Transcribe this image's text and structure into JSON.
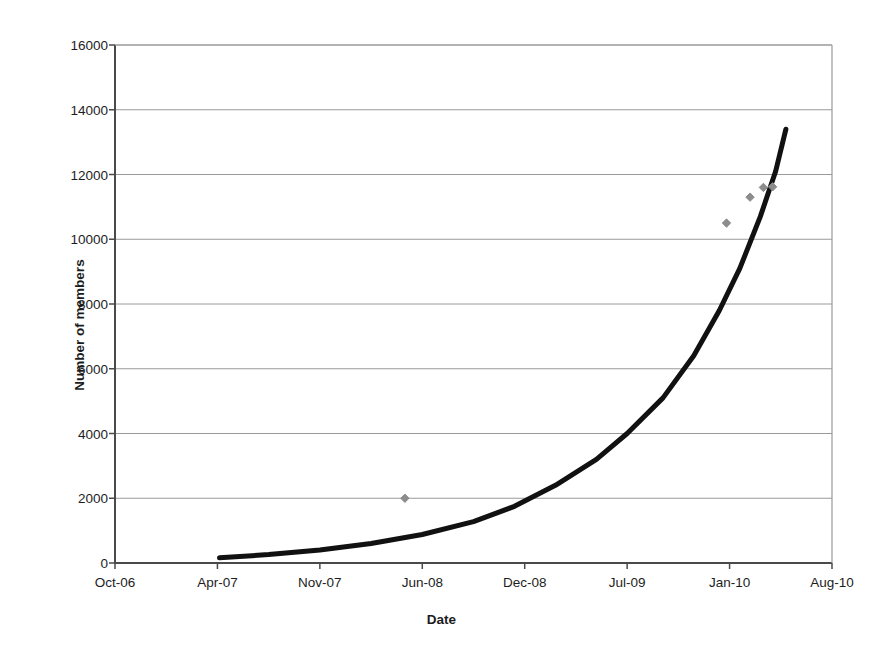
{
  "figure": {
    "title_remnant": "· · ·",
    "background": "#ffffff",
    "axis_color": "#4a4a4a",
    "grid_color": "#9a9a9a",
    "curve_color": "#111111",
    "marker_color": "#8c8c8c"
  },
  "chart_data": {
    "type": "scatter",
    "title": "",
    "xlabel": "Date",
    "ylabel": "Number of members",
    "grid": true,
    "legend": "none",
    "ylim": [
      0,
      16000
    ],
    "ytick_labels": [
      "0",
      "2000",
      "4000",
      "6000",
      "8000",
      "10000",
      "12000",
      "14000",
      "16000"
    ],
    "ytick_values": [
      0,
      2000,
      4000,
      6000,
      8000,
      10000,
      12000,
      14000,
      16000
    ],
    "xtick_labels": [
      "Oct-06",
      "Apr-07",
      "Nov-07",
      "Jun-08",
      "Dec-08",
      "Jul-09",
      "Jan-10",
      "Aug-10"
    ],
    "xtick_values": [
      0,
      1,
      2,
      3,
      4,
      5,
      6,
      7
    ],
    "series": [
      {
        "name": "Members (observed)",
        "type": "scatter",
        "marker": "diamond",
        "color": "#8c8c8c",
        "points": [
          {
            "x": 2.83,
            "y": 2000
          },
          {
            "x": 5.97,
            "y": 10500
          },
          {
            "x": 6.2,
            "y": 11300
          },
          {
            "x": 6.33,
            "y": 11600
          },
          {
            "x": 6.42,
            "y": 11620
          }
        ]
      },
      {
        "name": "Exponential trend",
        "type": "line",
        "color": "#111111",
        "linewidth": 5,
        "points": [
          {
            "x": 1.02,
            "y": 160
          },
          {
            "x": 1.5,
            "y": 260
          },
          {
            "x": 2.0,
            "y": 400
          },
          {
            "x": 2.5,
            "y": 600
          },
          {
            "x": 3.0,
            "y": 880
          },
          {
            "x": 3.5,
            "y": 1280
          },
          {
            "x": 3.9,
            "y": 1750
          },
          {
            "x": 4.3,
            "y": 2400
          },
          {
            "x": 4.7,
            "y": 3200
          },
          {
            "x": 5.0,
            "y": 4000
          },
          {
            "x": 5.35,
            "y": 5100
          },
          {
            "x": 5.65,
            "y": 6400
          },
          {
            "x": 5.9,
            "y": 7800
          },
          {
            "x": 6.1,
            "y": 9100
          },
          {
            "x": 6.3,
            "y": 10700
          },
          {
            "x": 6.45,
            "y": 12100
          },
          {
            "x": 6.55,
            "y": 13400
          }
        ]
      }
    ]
  }
}
